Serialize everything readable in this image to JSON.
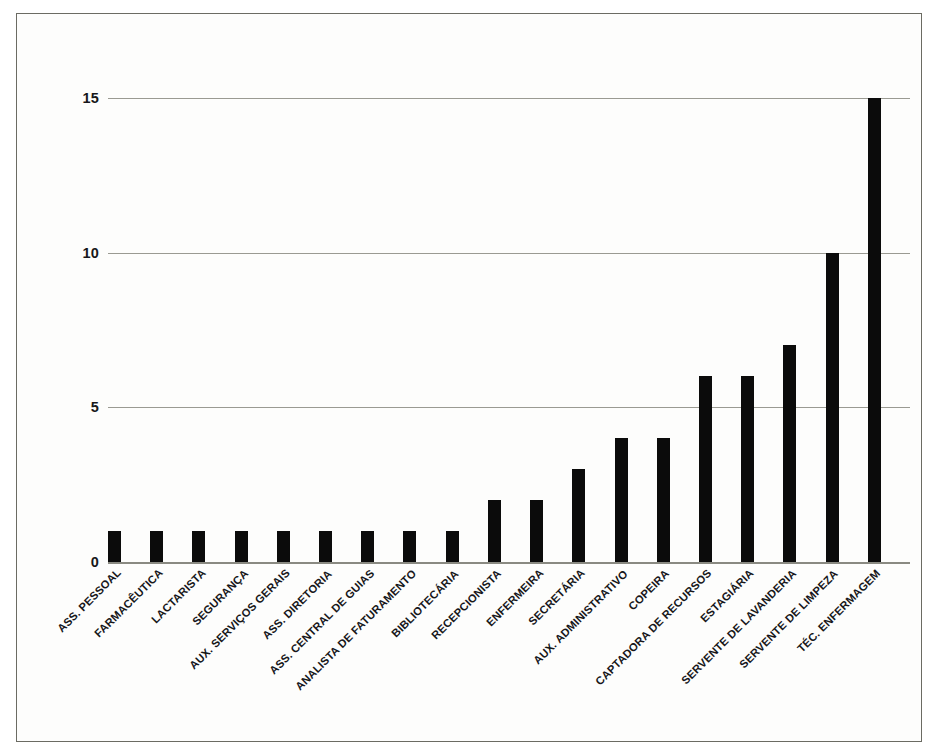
{
  "chart_data": {
    "type": "bar",
    "title": "",
    "subtitle": "",
    "xlabel": "",
    "ylabel": "",
    "ylim": [
      0,
      15
    ],
    "yticks": [
      0,
      5,
      10,
      15
    ],
    "ytick_labels": [
      "0",
      "5",
      "10",
      "15"
    ],
    "grid": "horizontal",
    "legend": "none",
    "bar_color": "#0b0b0b",
    "categories": [
      "ASS. PESSOAL",
      "FARMACÊUTICA",
      "LACTARISTA",
      "SEGURANÇA",
      "AUX. SERVIÇOS GERAIS",
      "ASS. DIRETORIA",
      "ASS. CENTRAL DE GUIAS",
      "ANALISTA DE FATURAMENTO",
      "BIBLIOTECÁRIA",
      "RECEPCIONISTA",
      "ENFERMEIRA",
      "SECRETÁRIA",
      "AUX. ADMINISTRATIVO",
      "COPEIRA",
      "CAPTADORA DE RECURSOS",
      "ESTAGIÁRIA",
      "SERVENTE DE LAVANDERIA",
      "SERVENTE DE LIMPEZA",
      "TÉC. ENFERMAGEM"
    ],
    "values": [
      1,
      1,
      1,
      1,
      1,
      1,
      1,
      1,
      1,
      2,
      2,
      3,
      4,
      4,
      6,
      6,
      7,
      10,
      15
    ]
  },
  "figure": {
    "background_color": "#fdfdfc",
    "border_color": "#6b6b63"
  }
}
